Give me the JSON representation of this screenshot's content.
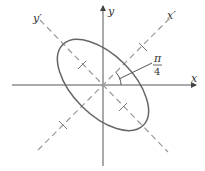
{
  "diagram": {
    "axes": {
      "x_label": "x",
      "y_label": "y",
      "x_prime_label": "x′",
      "y_prime_label": "y′"
    },
    "angle_label": {
      "numerator": "π",
      "denominator": "4"
    },
    "colors": {
      "axis": "#555555",
      "rotated_axis": "#999999",
      "ellipse": "#666666",
      "text": "#333333"
    }
  }
}
